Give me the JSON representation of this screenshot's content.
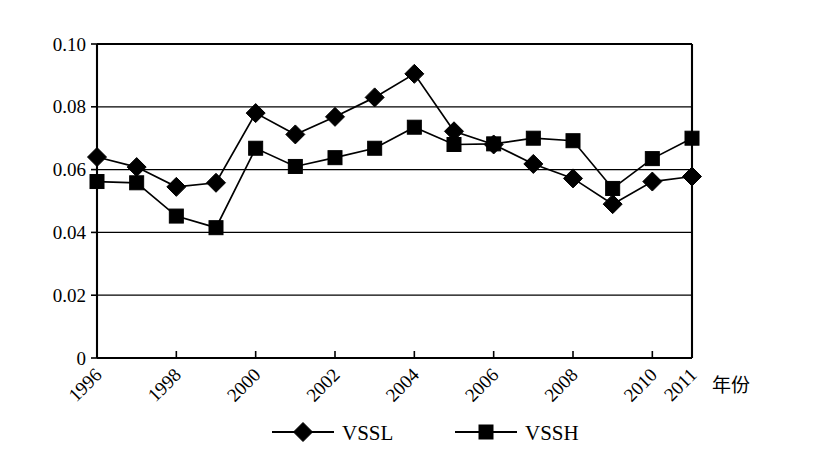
{
  "chart_data": {
    "type": "line",
    "title": "",
    "subtitle": "",
    "xlabel": "年份",
    "ylabel": "",
    "x": [
      1996,
      1997,
      1998,
      1999,
      2000,
      2001,
      2002,
      2003,
      2004,
      2005,
      2006,
      2007,
      2008,
      2009,
      2010,
      2011
    ],
    "categories": [
      "1996",
      "1997",
      "1998",
      "1999",
      "2000",
      "2001",
      "2002",
      "2003",
      "2004",
      "2005",
      "2006",
      "2007",
      "2008",
      "2009",
      "2010",
      "2011"
    ],
    "xtick_labels": [
      "1996",
      "1998",
      "2000",
      "2002",
      "2004",
      "2006",
      "2008",
      "2010",
      "2011"
    ],
    "xtick_values": [
      1996,
      1998,
      2000,
      2002,
      2004,
      2006,
      2008,
      2010,
      2011
    ],
    "ytick_labels": [
      "0",
      "0.02",
      "0.04",
      "0.06",
      "0.08",
      "0.10"
    ],
    "ytick_values": [
      0,
      0.02,
      0.04,
      0.06,
      0.08,
      0.1
    ],
    "xlim": [
      1996,
      2011
    ],
    "ylim": [
      0,
      0.1
    ],
    "grid": "horizontal",
    "legend_position": "bottom",
    "series": [
      {
        "name": "VSSL",
        "marker": "diamond",
        "color": "#000000",
        "values": [
          0.064,
          0.0608,
          0.0545,
          0.0558,
          0.078,
          0.0712,
          0.0768,
          0.083,
          0.0905,
          0.0722,
          0.068,
          0.0618,
          0.0572,
          0.049,
          0.0562,
          0.0578
        ]
      },
      {
        "name": "VSSH",
        "marker": "square",
        "color": "#000000",
        "values": [
          0.0562,
          0.0558,
          0.0452,
          0.0415,
          0.0668,
          0.061,
          0.0638,
          0.0668,
          0.0735,
          0.068,
          0.0682,
          0.07,
          0.0692,
          0.054,
          0.0635,
          0.07
        ]
      }
    ]
  },
  "legend": {
    "items": [
      {
        "label": "VSSL",
        "marker": "diamond"
      },
      {
        "label": "VSSH",
        "marker": "square"
      }
    ]
  },
  "axes": {
    "x_axis_title": "年份"
  }
}
